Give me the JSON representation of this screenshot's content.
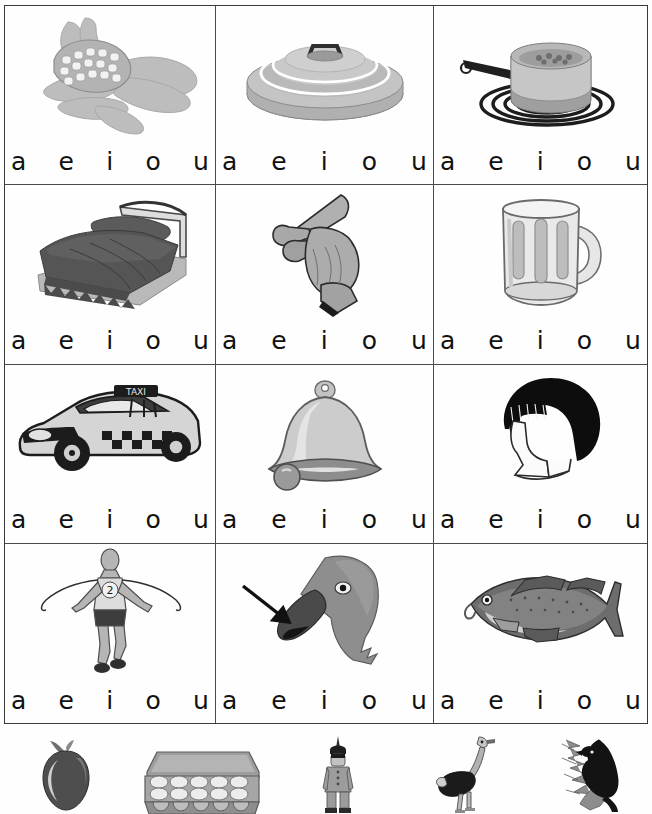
{
  "worksheet": {
    "title": "Vowel sounds picture worksheet",
    "vowel_options": [
      "a",
      "e",
      "i",
      "o",
      "u"
    ],
    "grid": {
      "rows": 4,
      "columns": 3,
      "cells": [
        {
          "position": "row1-col1",
          "picture": "corn-cob-icon",
          "picture_label": "corn",
          "vowels": [
            "a",
            "e",
            "i",
            "o",
            "u"
          ]
        },
        {
          "position": "row1-col2",
          "picture": "pot-lid-icon",
          "picture_label": "lid",
          "vowels": [
            "a",
            "e",
            "i",
            "o",
            "u"
          ]
        },
        {
          "position": "row1-col3",
          "picture": "saucepan-on-burner-icon",
          "picture_label": "pot",
          "vowels": [
            "a",
            "e",
            "i",
            "o",
            "u"
          ]
        },
        {
          "position": "row2-col1",
          "picture": "bed-icon",
          "picture_label": "bed",
          "vowels": [
            "a",
            "e",
            "i",
            "o",
            "u"
          ]
        },
        {
          "position": "row2-col2",
          "picture": "pointing-hand-icon",
          "picture_label": "finger",
          "vowels": [
            "a",
            "e",
            "i",
            "o",
            "u"
          ]
        },
        {
          "position": "row2-col3",
          "picture": "beer-mug-icon",
          "picture_label": "mug",
          "vowels": [
            "a",
            "e",
            "i",
            "o",
            "u"
          ]
        },
        {
          "position": "row3-col1",
          "picture": "taxi-cab-icon",
          "picture_label": "cab",
          "vowels": [
            "a",
            "e",
            "i",
            "o",
            "u"
          ]
        },
        {
          "position": "row3-col2",
          "picture": "bell-icon",
          "picture_label": "bell",
          "vowels": [
            "a",
            "e",
            "i",
            "o",
            "u"
          ]
        },
        {
          "position": "row3-col3",
          "picture": "head-with-hair-icon",
          "picture_label": "hair",
          "vowels": [
            "a",
            "e",
            "i",
            "o",
            "u"
          ]
        },
        {
          "position": "row4-col1",
          "picture": "runner-winner-icon",
          "picture_label": "win",
          "vowels": [
            "a",
            "e",
            "i",
            "o",
            "u"
          ]
        },
        {
          "position": "row4-col2",
          "picture": "bird-bill-with-arrow-icon",
          "picture_label": "bill",
          "vowels": [
            "a",
            "e",
            "i",
            "o",
            "u"
          ]
        },
        {
          "position": "row4-col3",
          "picture": "fish-cod-icon",
          "picture_label": "cod",
          "vowels": [
            "a",
            "e",
            "i",
            "o",
            "u"
          ]
        }
      ]
    },
    "bottom_strip": {
      "items": [
        {
          "picture": "apple-icon",
          "picture_label": "apple"
        },
        {
          "picture": "egg-carton-icon",
          "picture_label": "eggs"
        },
        {
          "picture": "standing-person-icon",
          "picture_label": "indian"
        },
        {
          "picture": "ostrich-icon",
          "picture_label": "ostrich"
        },
        {
          "picture": "umbrella-bird-icon",
          "picture_label": "umbrella bird"
        }
      ]
    },
    "runner_bib_number": "2",
    "taxi_sign_text": "TAXI",
    "colors": {
      "page_background": "#ffffff",
      "border": "#4a4a4a",
      "text": "#111111",
      "art_gray_light": "#c9c9c9",
      "art_gray_mid": "#9a9a9a",
      "art_gray_dark": "#5e5e5e",
      "art_black": "#151515"
    }
  }
}
